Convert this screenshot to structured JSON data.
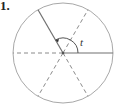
{
  "problem_number": "1.",
  "diagram": {
    "type": "unit-circle-angle",
    "center": [
      63,
      53
    ],
    "radius": 50,
    "radii_degrees": [
      0,
      60,
      120,
      180,
      240,
      300
    ],
    "solid_radii_degrees": [
      0,
      120
    ],
    "dashed_radii_degrees": [
      60,
      180,
      240,
      300
    ],
    "angle_label": "t",
    "angle_from_deg": 0,
    "angle_to_deg": 120,
    "line_color": "#9a9a9a",
    "solid_color": "#777777"
  }
}
